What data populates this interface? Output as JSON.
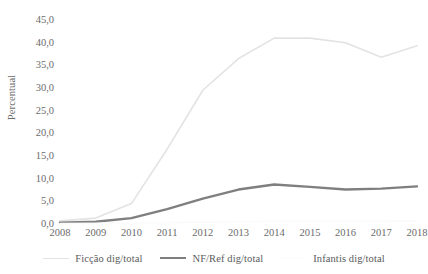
{
  "chart_data": {
    "type": "line",
    "title": "",
    "subtitle": "",
    "xlabel": "",
    "ylabel": "Percentual",
    "x": [
      "2008",
      "2009",
      "2010",
      "2011",
      "2012",
      "2013",
      "2014",
      "2015",
      "2016",
      "2017",
      "2018"
    ],
    "categories": [
      "2008",
      "2009",
      "2010",
      "2011",
      "2012",
      "2013",
      "2014",
      "2015",
      "2016",
      "2017",
      "2018"
    ],
    "ylim": [
      0,
      45
    ],
    "ytick_labels": [
      "0,0",
      "5,0",
      "10,0",
      "15,0",
      "20,0",
      "25,0",
      "30,0",
      "35,0",
      "40,0",
      "45,0"
    ],
    "ytick_values": [
      0,
      5,
      10,
      15,
      20,
      25,
      30,
      35,
      40,
      45
    ],
    "grid": false,
    "legend_position": "bottom",
    "series": [
      {
        "name": "Ficção dig/total",
        "color": "#e3e3e3",
        "width": 1.6,
        "values": [
          0.7,
          1.3,
          4.5,
          16.5,
          29.5,
          36.5,
          41.0,
          41.0,
          40.0,
          36.8,
          39.3
        ]
      },
      {
        "name": "NF/Ref dig/total",
        "color": "#7f7f7f",
        "width": 2.4,
        "values": [
          0.3,
          0.5,
          1.3,
          3.3,
          5.6,
          7.6,
          8.7,
          8.2,
          7.6,
          7.8,
          8.3
        ]
      },
      {
        "name": "Infantis dig/total",
        "color": "#fbfbfb",
        "width": 1.6,
        "values": [
          0.1,
          0.15,
          0.2,
          0.3,
          0.4,
          0.5,
          0.6,
          0.6,
          0.6,
          0.6,
          0.7
        ]
      }
    ]
  },
  "legend": {
    "items": [
      {
        "label": "Ficção dig/total"
      },
      {
        "label": "NF/Ref dig/total"
      },
      {
        "label": "Infantis dig/total"
      }
    ]
  }
}
